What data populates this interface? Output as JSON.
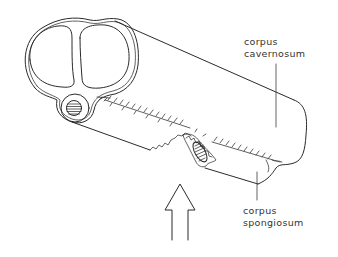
{
  "figure": {
    "ink_color": "#2a2a2a",
    "background": "#ffffff"
  },
  "labels": {
    "cavernosum": {
      "line1": "corpus",
      "line2": "cavernosum"
    },
    "spongiosum": {
      "line1": "corpus",
      "line2": "spongiosum"
    }
  },
  "annotations": {
    "arrow": "force-direction-arrow",
    "tear": "fracture-site"
  }
}
